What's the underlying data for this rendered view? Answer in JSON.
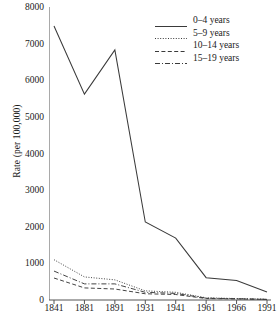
{
  "chart_data": {
    "type": "line",
    "title": "",
    "xlabel": "",
    "ylabel": "Rate (per 100,000)",
    "categories": [
      "1841",
      "1881",
      "1891",
      "1931",
      "1941",
      "1961",
      "1966",
      "1991"
    ],
    "ylim": [
      0,
      8000
    ],
    "ytick_values": [
      0,
      1000,
      2000,
      3000,
      4000,
      5000,
      6000,
      7000,
      8000
    ],
    "ytick_labels": [
      "0",
      "1000",
      "2000",
      "3000",
      "4000",
      "5000",
      "6000",
      "7000",
      "8000"
    ],
    "grid": false,
    "legend_position": "top-right",
    "series": [
      {
        "name": "0–4 years",
        "style": "solid",
        "color": "#3a3a3a",
        "values": [
          7480,
          5620,
          6830,
          2130,
          1690,
          610,
          530,
          220
        ]
      },
      {
        "name": "5–9 years",
        "style": "dotted",
        "color": "#3a3a3a",
        "values": [
          1100,
          630,
          550,
          250,
          210,
          60,
          40,
          20
        ]
      },
      {
        "name": "10–14 years",
        "style": "dashed",
        "color": "#3a3a3a",
        "values": [
          600,
          330,
          300,
          170,
          150,
          40,
          30,
          15
        ]
      },
      {
        "name": "15–19 years",
        "style": "dashdot",
        "color": "#3a3a3a",
        "values": [
          790,
          440,
          440,
          210,
          180,
          50,
          35,
          18
        ]
      }
    ]
  },
  "axis": {
    "ylabel": "Rate (per 100,000)"
  },
  "legend": {
    "items": [
      {
        "label": "0–4 years"
      },
      {
        "label": "5–9 years"
      },
      {
        "label": "10–14 years"
      },
      {
        "label": "15–19 years"
      }
    ]
  }
}
